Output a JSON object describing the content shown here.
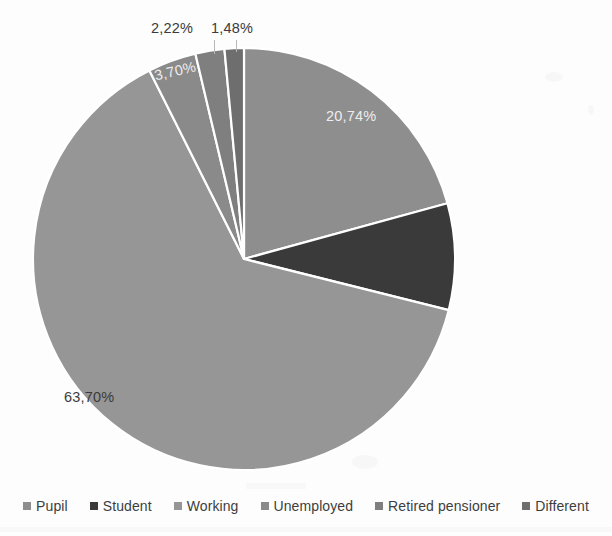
{
  "chart_data": {
    "type": "pie",
    "title": "",
    "subtitle": "",
    "xlabel": "",
    "ylabel": "",
    "decimal_separator": ",",
    "value_suffix": "%",
    "legend_position": "bottom",
    "grid": false,
    "start_angle_deg": 0,
    "direction": "clockwise",
    "categories": [
      "Pupil",
      "Student",
      "Working",
      "Unemployed",
      "Retired pensioner",
      "Different"
    ],
    "values": [
      20.74,
      8.16,
      63.7,
      3.7,
      2.22,
      1.48
    ],
    "labels": [
      "20,74%",
      "",
      "63,70%",
      "3,70%",
      "2,22%",
      "1,48%"
    ],
    "colors": [
      "#8e8e8e",
      "#3a3a3a",
      "#969696",
      "#8a8a8a",
      "#7f7f7f",
      "#6e6e6e"
    ],
    "slice_border_color": "#ffffff",
    "slices": [
      {
        "name": "Pupil",
        "value": 20.74,
        "label": "20,74%",
        "color": "#8e8e8e",
        "label_color": "light"
      },
      {
        "name": "Student",
        "value": 8.16,
        "label": "",
        "color": "#3a3a3a",
        "label_color": "light"
      },
      {
        "name": "Working",
        "value": 63.7,
        "label": "63,70%",
        "color": "#969696",
        "label_color": "dark"
      },
      {
        "name": "Unemployed",
        "value": 3.7,
        "label": "3,70%",
        "color": "#8a8a8a",
        "label_color": "light"
      },
      {
        "name": "Retired pensioner",
        "value": 2.22,
        "label": "2,22%",
        "color": "#7f7f7f",
        "label_color": "dark"
      },
      {
        "name": "Different",
        "value": 1.48,
        "label": "1,48%",
        "color": "#6e6e6e",
        "label_color": "dark"
      }
    ]
  },
  "labels": {
    "pupil_pct": "20,74%",
    "working_pct": "63,70%",
    "unemployed_pct": "3,70%",
    "retired_pct": "2,22%",
    "different_pct": "1,48%"
  },
  "legend": {
    "items": [
      {
        "label": "Pupil",
        "color": "#8e8e8e"
      },
      {
        "label": "Student",
        "color": "#3a3a3a"
      },
      {
        "label": "Working",
        "color": "#969696"
      },
      {
        "label": "Unemployed",
        "color": "#8a8a8a"
      },
      {
        "label": "Retired pensioner",
        "color": "#7f7f7f"
      },
      {
        "label": "Different",
        "color": "#6e6e6e"
      }
    ]
  },
  "geometry": {
    "center_x": 244,
    "center_y": 259,
    "radius": 211
  }
}
